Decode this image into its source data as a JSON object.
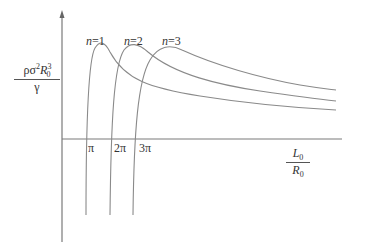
{
  "diagram": {
    "y_axis_label": {
      "numerator": "ρσ²R₀³",
      "num_parts": [
        "ρσ",
        "2",
        "R",
        "0",
        "3"
      ],
      "denominator": "γ"
    },
    "x_axis_label": {
      "numerator": "L",
      "num_sub": "0",
      "denominator": "R",
      "den_sub": "0"
    },
    "x_ticks": [
      "π",
      "2π",
      "3π"
    ],
    "curves": [
      {
        "label_var": "n",
        "label_eq": "=1"
      },
      {
        "label_var": "n",
        "label_eq": "=2"
      },
      {
        "label_var": "n",
        "label_eq": "=3"
      }
    ],
    "colors": {
      "axis": "#777777",
      "curve": "#8a8a8a",
      "text": "#333333"
    }
  }
}
